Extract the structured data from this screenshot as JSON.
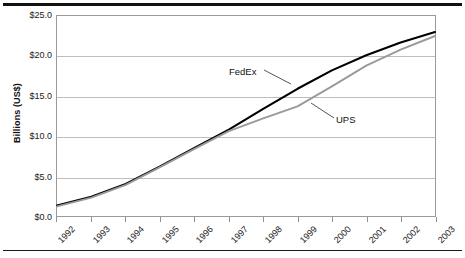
{
  "chart_data": {
    "type": "line",
    "title": "",
    "subtitle": "",
    "xlabel": "",
    "ylabel": "Billions (US$)",
    "x": [
      1992,
      1993,
      1994,
      1995,
      1996,
      1997,
      1998,
      1999,
      2000,
      2001,
      2002,
      2003
    ],
    "categories": [
      "1992",
      "1993",
      "1994",
      "1995",
      "1996",
      "1997",
      "1998",
      "1999",
      "2000",
      "2001",
      "2002",
      "2003"
    ],
    "series": [
      {
        "name": "FedEx",
        "color": "#000000",
        "values": [
          1.3,
          2.4,
          4.0,
          6.2,
          8.5,
          10.8,
          13.4,
          15.9,
          18.2,
          20.1,
          21.7,
          23.0
        ]
      },
      {
        "name": "UPS",
        "color": "#9a9a9a",
        "values": [
          1.2,
          2.3,
          3.9,
          6.1,
          8.4,
          10.6,
          12.2,
          13.7,
          16.2,
          18.8,
          20.8,
          22.5
        ]
      }
    ],
    "ylim": [
      0.0,
      25.0
    ],
    "yticks": [
      0.0,
      5.0,
      10.0,
      15.0,
      20.0,
      25.0
    ],
    "ytick_labels": [
      "$0.0",
      "$5.0",
      "$10.0",
      "$15.0",
      "$20.0",
      "$25.0"
    ],
    "xlim": [
      1992,
      2003
    ],
    "grid": "horizontal",
    "legend_position": "inline-annotations",
    "annotations": [
      {
        "label": "FedEx",
        "series": "FedEx"
      },
      {
        "label": "UPS",
        "series": "UPS"
      }
    ]
  },
  "figure": {
    "y_axis_title": "Billions (US$)",
    "annotation_fedex": "FedEx",
    "annotation_ups": "UPS"
  }
}
